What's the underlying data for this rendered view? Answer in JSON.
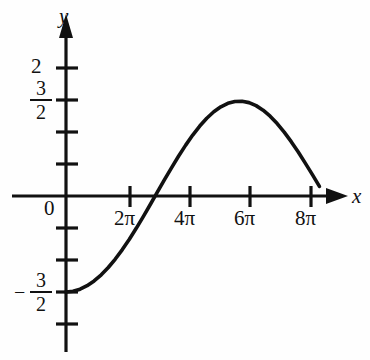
{
  "figure": {
    "kind": "cartesian-graph",
    "background": "#fefefe",
    "ink_color": "#111111",
    "axis_labels": {
      "x": "x",
      "y": "y"
    },
    "origin_label": "0"
  },
  "y_axis": {
    "labels": [
      {
        "text": "2",
        "value": 2
      },
      {
        "text": "3/2",
        "numerator": "3",
        "denominator": "2",
        "value": 1.5,
        "sign": ""
      },
      {
        "text": "-3/2",
        "numerator": "3",
        "denominator": "2",
        "value": -1.5,
        "sign": "−"
      }
    ],
    "tick_values": [
      2,
      1.5,
      1,
      0.5,
      -0.5,
      -1,
      -1.5,
      -2
    ]
  },
  "x_axis": {
    "tick_labels": [
      "2π",
      "4π",
      "6π",
      "8π"
    ],
    "tick_values": [
      6.283,
      12.566,
      18.85,
      25.133
    ]
  },
  "chart_data": {
    "type": "line",
    "title": "",
    "xlabel": "x",
    "ylabel": "y",
    "xlim": [
      0,
      27.5
    ],
    "ylim": [
      -2.2,
      2.4
    ],
    "grid": false,
    "legend": null,
    "equation": "y = -(3/2)cos(x/4)",
    "amplitude": 1.5,
    "period": 25.133,
    "annotations": [
      {
        "label": "minimum at x=0",
        "x": 0,
        "y": -1.5
      },
      {
        "label": "zero crossing",
        "x": 6.283,
        "y": 0
      },
      {
        "label": "maximum",
        "x": 12.566,
        "y": 1.5
      },
      {
        "label": "zero crossing",
        "x": 18.85,
        "y": 0
      }
    ],
    "x": [
      0.0,
      0.69,
      1.38,
      2.07,
      2.76,
      3.46,
      4.15,
      4.84,
      5.53,
      6.22,
      6.91,
      7.6,
      8.29,
      8.98,
      9.67,
      10.37,
      11.06,
      11.75,
      12.44,
      13.13,
      13.82,
      14.51,
      15.2,
      15.89,
      16.58,
      17.28,
      17.97,
      18.66,
      19.35,
      20.04,
      20.73,
      21.42,
      22.11,
      22.8,
      23.49,
      24.19,
      24.88
    ],
    "y": [
      -1.5,
      -1.489,
      -1.456,
      -1.402,
      -1.327,
      -1.231,
      -1.117,
      -0.985,
      -0.837,
      -0.675,
      -0.501,
      -0.318,
      -0.129,
      0.064,
      0.256,
      0.444,
      0.625,
      0.795,
      0.952,
      1.093,
      1.215,
      1.316,
      1.394,
      1.448,
      1.477,
      1.481,
      1.459,
      1.412,
      1.341,
      1.247,
      1.132,
      0.998,
      0.849,
      0.687,
      0.514,
      0.334,
      0.15
    ],
    "series": [
      {
        "name": "y = -(3/2)cos(x/4)",
        "values": [
          -1.5,
          -1.489,
          -1.456,
          -1.402,
          -1.327,
          -1.231,
          -1.117,
          -0.985,
          -0.837,
          -0.675,
          -0.501,
          -0.318,
          -0.129,
          0.064,
          0.256,
          0.444,
          0.625,
          0.795,
          0.952,
          1.093,
          1.215,
          1.316,
          1.394,
          1.448,
          1.477,
          1.481,
          1.459,
          1.412,
          1.341,
          1.247,
          1.132,
          0.998,
          0.849,
          0.687,
          0.514,
          0.334,
          0.15
        ]
      }
    ]
  }
}
